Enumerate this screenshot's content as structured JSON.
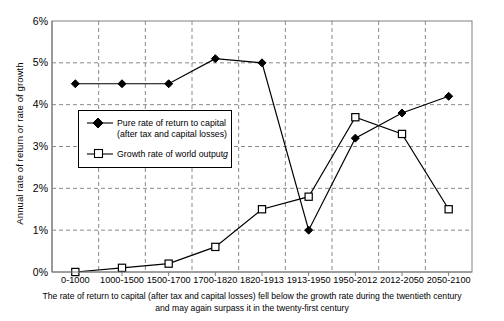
{
  "chart_data": {
    "type": "line",
    "title": "",
    "subtitle": "",
    "xlabel": "",
    "ylabel": "Annual rate of return or rate of growth",
    "categories": [
      "0-1000",
      "1000-1500",
      "1500-1700",
      "1700-1820",
      "1820-1913",
      "1913-1950",
      "1950-2012",
      "2012-2050",
      "2050-2100"
    ],
    "ylim": [
      0,
      6
    ],
    "ytick_labels": [
      "0%",
      "1%",
      "2%",
      "3%",
      "4%",
      "5%",
      "6%"
    ],
    "ytick_values": [
      0,
      1,
      2,
      3,
      4,
      5,
      6
    ],
    "grid": "dashed-both-axes",
    "legend_position": "inside-left-middle",
    "series": [
      {
        "name": "Pure rate of return to capital (after tax and capital losses)",
        "marker": "filled-diamond",
        "color": "#000000",
        "values": [
          4.5,
          4.5,
          4.5,
          5.1,
          5.0,
          1.0,
          3.2,
          3.8,
          4.2
        ]
      },
      {
        "name": "Growth rate of world output g",
        "marker": "open-square",
        "color": "#000000",
        "values": [
          0.0,
          0.1,
          0.2,
          0.6,
          1.5,
          1.8,
          3.7,
          3.3,
          1.5
        ]
      }
    ],
    "annotations": [
      "The rate of return to capital (after tax and capital losses) fell below the growth rate during the twentieth century",
      "and may again surpass it in the twenty-first century"
    ]
  },
  "legend": {
    "entry1_line1": "Pure rate of return to capital",
    "entry1_line2": "(after tax and capital losses)",
    "entry2_text": "Growth rate of world output",
    "entry2_italic": "g"
  },
  "caption": {
    "line1": "The rate of return to capital (after tax and capital losses) fell below the growth rate during the twentieth century",
    "line2": "and may again surpass it in the twenty-first century"
  }
}
